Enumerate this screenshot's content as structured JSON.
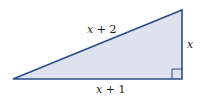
{
  "figure": {
    "type": "right-triangle",
    "colors": {
      "fill": "#dde2ee",
      "stroke": "#2b4f8c",
      "text": "#1a1a1a"
    },
    "vertices": {
      "left": [
        13,
        79
      ],
      "bottom_right": [
        182,
        79
      ],
      "top_right": [
        182,
        10
      ]
    },
    "right_angle_marker": true,
    "labels": {
      "hypotenuse": {
        "var": "x",
        "rest": " + 2"
      },
      "vertical_leg": {
        "var": "x"
      },
      "horizontal_leg": {
        "var": "x",
        "rest": " + 1"
      }
    }
  }
}
